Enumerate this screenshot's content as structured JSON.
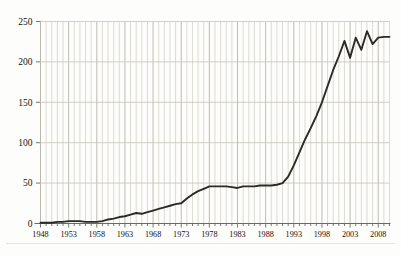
{
  "chart_data": {
    "type": "line",
    "title": "",
    "subtitle": "",
    "xlabel": "",
    "ylabel": "",
    "xlim": [
      1948,
      2010
    ],
    "ylim": [
      0,
      250
    ],
    "yticks": [
      0,
      50,
      100,
      150,
      200,
      250
    ],
    "ytick_labels": [
      "0",
      "50",
      "100",
      "150",
      "200",
      "250"
    ],
    "xticks": [
      1948,
      1953,
      1958,
      1963,
      1968,
      1973,
      1978,
      1983,
      1988,
      1993,
      1998,
      2003,
      2008
    ],
    "xtick_labels": [
      "1948",
      "1953",
      "1958",
      "1963",
      "1968",
      "1973",
      "1978",
      "1983",
      "1988",
      "1993",
      "1998",
      "2003",
      "2008"
    ],
    "grid": "both",
    "grid_minor_x": "every year",
    "legend": "none",
    "line_color": "#2b2a26",
    "grid_color": "#cfcdc4",
    "background_color": "#fdfdfb",
    "series": [
      {
        "name": "value",
        "x": [
          1948,
          1949,
          1950,
          1951,
          1952,
          1953,
          1954,
          1955,
          1956,
          1957,
          1958,
          1959,
          1960,
          1961,
          1962,
          1963,
          1964,
          1965,
          1966,
          1967,
          1968,
          1969,
          1970,
          1971,
          1972,
          1973,
          1974,
          1975,
          1976,
          1977,
          1978,
          1979,
          1980,
          1981,
          1982,
          1983,
          1984,
          1985,
          1986,
          1987,
          1988,
          1989,
          1990,
          1991,
          1992,
          1993,
          1994,
          1995,
          1996,
          1997,
          1998,
          1999,
          2000,
          2001,
          2002,
          2003,
          2004,
          2005,
          2006,
          2007,
          2008,
          2009,
          2010
        ],
        "values": [
          1,
          1,
          1,
          2,
          2,
          3,
          3,
          3,
          2,
          2,
          2,
          3,
          5,
          6,
          8,
          9,
          11,
          13,
          12,
          14,
          16,
          18,
          20,
          22,
          24,
          25,
          31,
          36,
          40,
          43,
          46,
          46,
          46,
          46,
          45,
          44,
          46,
          46,
          46,
          47,
          47,
          47,
          48,
          50,
          58,
          72,
          88,
          104,
          118,
          133,
          150,
          170,
          190,
          207,
          226,
          205,
          230,
          215,
          238,
          222,
          230,
          231,
          231
        ]
      }
    ]
  }
}
